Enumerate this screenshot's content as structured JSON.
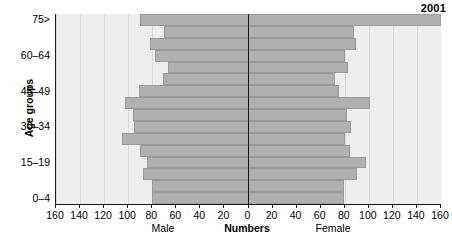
{
  "title": "2001",
  "axes": {
    "y_title": "Age groups",
    "x_center_caption": "Numbers",
    "left_caption": "Male",
    "right_caption": "Female",
    "x_ticks": [
      "160",
      "140",
      "120",
      "100",
      "80",
      "60",
      "40",
      "20",
      "0",
      "20",
      "40",
      "60",
      "80",
      "100",
      "120",
      "140",
      "160"
    ],
    "y_tick_labels": [
      "75>",
      "60–64",
      "45–49",
      "30–34",
      "15–19",
      "0–4"
    ]
  },
  "colors": {
    "bar_fill": "#b0b0b0",
    "bar_edge": "#9a9a9a",
    "plot_bg": "#eeeeee",
    "grid": "#d9d9d9",
    "axis": "#1a1a1a",
    "text": "#000000"
  },
  "chart_data": {
    "type": "bar",
    "subtype": "population-pyramid",
    "title": "2001",
    "xlabel": "Numbers",
    "ylabel": "Age groups",
    "xlim": [
      -160,
      160
    ],
    "xticks": [
      -160,
      -140,
      -120,
      -100,
      -80,
      -60,
      -40,
      -20,
      0,
      20,
      40,
      60,
      80,
      100,
      120,
      140,
      160
    ],
    "xticklabels": [
      "160",
      "140",
      "120",
      "100",
      "80",
      "60",
      "40",
      "20",
      "0",
      "20",
      "40",
      "60",
      "80",
      "100",
      "120",
      "140",
      "160"
    ],
    "grid": true,
    "legend": false,
    "categories": [
      "0–4",
      "5–9",
      "10–14",
      "15–19",
      "20–24",
      "25–29",
      "30–34",
      "35–39",
      "40–44",
      "45–49",
      "50–54",
      "55–59",
      "60–64",
      "65–69",
      "70–74",
      "75>"
    ],
    "series": [
      {
        "name": "Male",
        "side": "left",
        "values": [
          80,
          80,
          88,
          84,
          90,
          105,
          95,
          96,
          103,
          91,
          71,
          67,
          78,
          82,
          70,
          90
        ]
      },
      {
        "name": "Female",
        "side": "right",
        "values": [
          79,
          79,
          90,
          98,
          84,
          80,
          85,
          82,
          101,
          75,
          72,
          83,
          80,
          89,
          88,
          80
        ]
      }
    ],
    "note_75plus_female": 160,
    "annotations": [
      {
        "text": "2001",
        "position": "top-right"
      }
    ]
  }
}
